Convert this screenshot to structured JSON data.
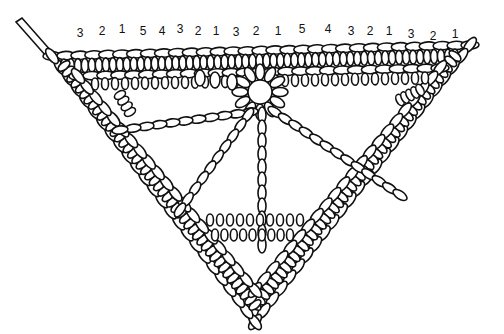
{
  "diagram": {
    "stitch_count_labels": [
      {
        "text": "3",
        "x": 80,
        "y": 27
      },
      {
        "text": "2",
        "x": 102,
        "y": 25
      },
      {
        "text": "1",
        "x": 122,
        "y": 23
      },
      {
        "text": "5",
        "x": 143,
        "y": 25
      },
      {
        "text": "4",
        "x": 162,
        "y": 25
      },
      {
        "text": "3",
        "x": 180,
        "y": 23
      },
      {
        "text": "2",
        "x": 198,
        "y": 25
      },
      {
        "text": "1",
        "x": 216,
        "y": 25
      },
      {
        "text": "3",
        "x": 236,
        "y": 26
      },
      {
        "text": "2",
        "x": 256,
        "y": 25
      },
      {
        "text": "1",
        "x": 278,
        "y": 25
      },
      {
        "text": "5",
        "x": 302,
        "y": 23
      },
      {
        "text": "4",
        "x": 328,
        "y": 23
      },
      {
        "text": "3",
        "x": 351,
        "y": 25
      },
      {
        "text": "2",
        "x": 370,
        "y": 25
      },
      {
        "text": "1",
        "x": 389,
        "y": 25
      },
      {
        "text": "3",
        "x": 411,
        "y": 28
      },
      {
        "text": "2",
        "x": 433,
        "y": 30
      },
      {
        "text": "1",
        "x": 455,
        "y": 28
      }
    ],
    "colors": {
      "line": "#111111",
      "fill": "#ffffff",
      "background": "#ffffff"
    }
  }
}
